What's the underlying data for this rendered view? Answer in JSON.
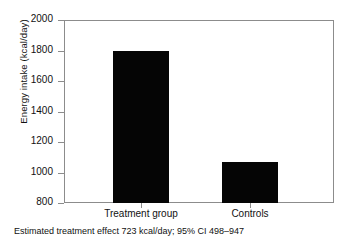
{
  "chart_data": {
    "type": "bar",
    "title": "",
    "subtitle": "",
    "categories": [
      "Treatment group",
      "Controls"
    ],
    "values": [
      1800,
      1070
    ],
    "xlabel": "",
    "ylabel": "Energy intake (kcal/day)",
    "ylim": [
      800,
      2000
    ],
    "ytick_labels": [
      "800",
      "1000",
      "1200",
      "1400",
      "1600",
      "1800",
      "2000"
    ],
    "ytick_values": [
      800,
      1000,
      1200,
      1400,
      1600,
      1800,
      2000
    ],
    "ytick_step": 200,
    "grid": false,
    "legend": false,
    "legend_position": "none",
    "bar_color": "#050505",
    "frame_color": "#8c8c8c",
    "background_color": "#ffffff",
    "annotation": "Estimated treatment effect 723 kcal/day; 95% CI 498–947",
    "annotation_values": {
      "effect": 723,
      "effect_units": "kcal/day",
      "ci_level": "95%",
      "ci_low": 498,
      "ci_high": 947
    }
  },
  "figure": {
    "y_axis_title": "Energy intake (kcal/day)",
    "caption": "Estimated treatment effect 723 kcal/day; 95% CI 498–947",
    "y_ticks": [
      {
        "label": "2000"
      },
      {
        "label": "1800"
      },
      {
        "label": "1600"
      },
      {
        "label": "1400"
      },
      {
        "label": "1200"
      },
      {
        "label": "1000"
      },
      {
        "label": "800"
      }
    ],
    "x_ticks": [
      {
        "label": "Treatment group"
      },
      {
        "label": "Controls"
      }
    ]
  }
}
